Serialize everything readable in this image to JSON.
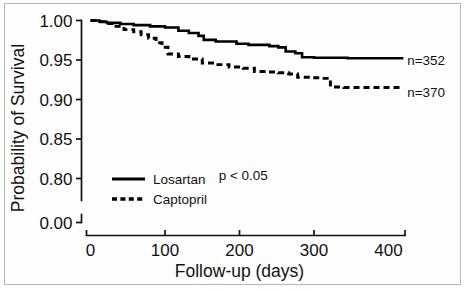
{
  "figure": {
    "frame_border_color": "#b9b9b9",
    "background_color": "#ffffff",
    "ink_color": "#000000"
  },
  "chart_data": {
    "type": "line",
    "subtype": "kaplan-meier-step",
    "title": "",
    "xlabel": "Follow-up (days)",
    "ylabel": "Probability of Survival",
    "xlim": [
      0,
      420
    ],
    "ylim": [
      0.785,
      1.0
    ],
    "grid": false,
    "legend_position": "lower-left-inside",
    "xticks": [
      0,
      100,
      200,
      300,
      400
    ],
    "xtick_labels": [
      "0",
      "100",
      "200",
      "300",
      "400"
    ],
    "yticks": [
      1.0,
      0.95,
      0.9,
      0.85,
      0.8,
      0.0
    ],
    "ytick_labels": [
      "1.00",
      "0.95",
      "0.90",
      "0.85",
      "0.80",
      "0.00"
    ],
    "y_axis_broken": true,
    "y_break_note": "axis broken between 0.80 and 0.00",
    "annotations": [
      {
        "name": "p-value",
        "text": "p < 0.05",
        "x": 205,
        "y": 0.8045
      },
      {
        "name": "n-losartan",
        "text": "n=352",
        "x": 425,
        "y": 0.9505
      },
      {
        "name": "n-captopril",
        "text": "n=370",
        "x": 425,
        "y": 0.9095
      }
    ],
    "series": [
      {
        "name": "Losartan",
        "label": "Losartan",
        "style": "solid",
        "n": 352,
        "points": [
          [
            0,
            1.0
          ],
          [
            12,
            1.0
          ],
          [
            12,
            0.9985
          ],
          [
            22,
            0.9985
          ],
          [
            22,
            0.997
          ],
          [
            40,
            0.997
          ],
          [
            40,
            0.9955
          ],
          [
            58,
            0.9955
          ],
          [
            58,
            0.9942
          ],
          [
            80,
            0.9942
          ],
          [
            80,
            0.9925
          ],
          [
            100,
            0.9925
          ],
          [
            100,
            0.9912
          ],
          [
            118,
            0.9912
          ],
          [
            118,
            0.987
          ],
          [
            132,
            0.987
          ],
          [
            132,
            0.9842
          ],
          [
            145,
            0.9842
          ],
          [
            145,
            0.9805
          ],
          [
            152,
            0.9805
          ],
          [
            152,
            0.9755
          ],
          [
            168,
            0.9755
          ],
          [
            168,
            0.9735
          ],
          [
            196,
            0.9735
          ],
          [
            196,
            0.9705
          ],
          [
            212,
            0.9705
          ],
          [
            212,
            0.9692
          ],
          [
            240,
            0.9692
          ],
          [
            240,
            0.9675
          ],
          [
            252,
            0.9675
          ],
          [
            252,
            0.966
          ],
          [
            262,
            0.966
          ],
          [
            262,
            0.9608
          ],
          [
            275,
            0.9608
          ],
          [
            275,
            0.9585
          ],
          [
            284,
            0.9585
          ],
          [
            284,
            0.9535
          ],
          [
            300,
            0.9535
          ],
          [
            300,
            0.9528
          ],
          [
            345,
            0.9528
          ],
          [
            345,
            0.9522
          ],
          [
            420,
            0.9522
          ]
        ]
      },
      {
        "name": "Captopril",
        "label": "Captopril",
        "style": "dashed",
        "n": 370,
        "points": [
          [
            0,
            1.0
          ],
          [
            10,
            1.0
          ],
          [
            10,
            0.9985
          ],
          [
            20,
            0.9985
          ],
          [
            20,
            0.9962
          ],
          [
            32,
            0.9962
          ],
          [
            32,
            0.9925
          ],
          [
            45,
            0.9925
          ],
          [
            45,
            0.9885
          ],
          [
            58,
            0.9885
          ],
          [
            58,
            0.9858
          ],
          [
            68,
            0.9858
          ],
          [
            68,
            0.982
          ],
          [
            78,
            0.982
          ],
          [
            78,
            0.9775
          ],
          [
            88,
            0.9775
          ],
          [
            88,
            0.9718
          ],
          [
            96,
            0.9718
          ],
          [
            96,
            0.9662
          ],
          [
            104,
            0.9662
          ],
          [
            104,
            0.9575
          ],
          [
            118,
            0.9575
          ],
          [
            118,
            0.9545
          ],
          [
            132,
            0.9545
          ],
          [
            132,
            0.9512
          ],
          [
            150,
            0.9512
          ],
          [
            150,
            0.9462
          ],
          [
            168,
            0.9462
          ],
          [
            168,
            0.9442
          ],
          [
            186,
            0.9442
          ],
          [
            186,
            0.9412
          ],
          [
            205,
            0.9412
          ],
          [
            205,
            0.9395
          ],
          [
            220,
            0.9395
          ],
          [
            220,
            0.9355
          ],
          [
            236,
            0.9355
          ],
          [
            236,
            0.9348
          ],
          [
            252,
            0.9348
          ],
          [
            252,
            0.9338
          ],
          [
            266,
            0.9338
          ],
          [
            266,
            0.9322
          ],
          [
            278,
            0.9322
          ],
          [
            278,
            0.9282
          ],
          [
            296,
            0.9282
          ],
          [
            296,
            0.9275
          ],
          [
            310,
            0.9275
          ],
          [
            310,
            0.9268
          ],
          [
            322,
            0.9268
          ],
          [
            322,
            0.9158
          ],
          [
            340,
            0.9158
          ],
          [
            340,
            0.9152
          ],
          [
            420,
            0.9152
          ]
        ]
      }
    ],
    "legend_entries": [
      {
        "label": "Losartan",
        "style": "solid"
      },
      {
        "label": "Captopril",
        "style": "dashed"
      }
    ]
  }
}
